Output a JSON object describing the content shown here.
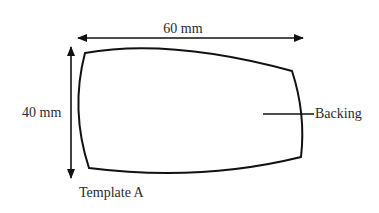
{
  "diagram": {
    "title": "Template A",
    "width_dimension": "60 mm",
    "height_dimension": "40 mm",
    "callout_label": "Backing",
    "colors": {
      "stroke": "#111111",
      "text": "#2a2a2a",
      "background": "#ffffff"
    }
  }
}
